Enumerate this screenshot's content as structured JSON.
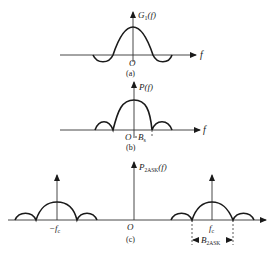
{
  "figure": {
    "panel_a": {
      "y_label_main": "G",
      "y_label_sub": "1",
      "y_label_arg": "(f)",
      "x_label": "f",
      "origin_label": "O",
      "caption": "(a)"
    },
    "panel_b": {
      "y_label_main": "P",
      "y_label_arg": "(f)",
      "x_label": "f",
      "origin_label": "O",
      "bandwidth_label_main": "B",
      "bandwidth_label_sub": "s",
      "caption": "(b)"
    },
    "panel_c": {
      "y_label_main": "P",
      "y_label_sub": "2ASK",
      "y_label_arg": "(f)",
      "origin_label": "O",
      "neg_carrier_label_main": "−f",
      "neg_carrier_label_sub": "c",
      "pos_carrier_label_main": "f",
      "pos_carrier_label_sub": "c",
      "bandwidth_label_main": "B",
      "bandwidth_label_sub": "2ASK",
      "caption": "(c)"
    }
  }
}
